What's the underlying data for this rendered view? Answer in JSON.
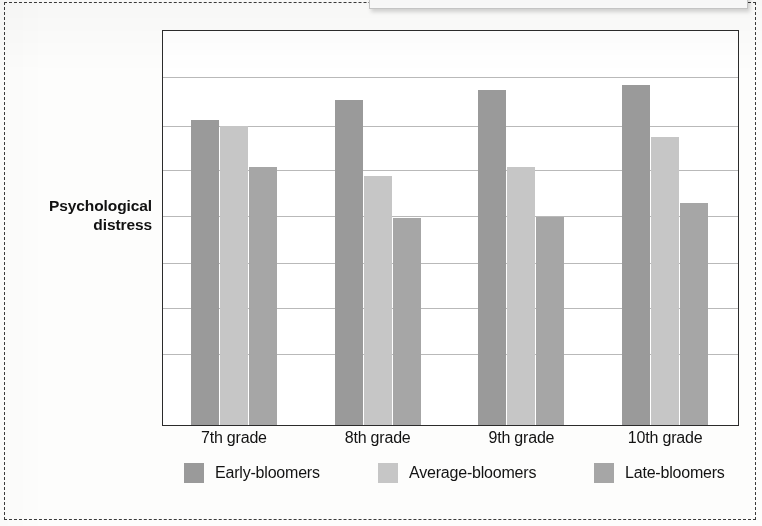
{
  "figure": {
    "frame_style": "dashed",
    "frame_color": "#3a3a3a",
    "background_color": "#fdfdfc"
  },
  "top_callout": {
    "visible_fragment": true,
    "text": "",
    "swatch_color": "#9b9b9b"
  },
  "y_axis_title": "Psychological distress",
  "legend": {
    "items": [
      {
        "label": "Early-bloomers",
        "color": "#9a9a9a",
        "left_px": 22
      },
      {
        "label": "Average-bloomers",
        "color": "#c6c6c6",
        "left_px": 216
      },
      {
        "label": "Late-bloomers",
        "color": "#a6a6a6",
        "left_px": 432
      }
    ]
  },
  "chart_data": {
    "type": "bar",
    "title": "",
    "subtitle": "",
    "xlabel": "",
    "ylabel": "Psychological distress",
    "categories": [
      "7th grade",
      "8th grade",
      "9th grade",
      "10th grade"
    ],
    "series": [
      {
        "name": "Early-bloomers",
        "color": "#9a9a9a",
        "values": [
          77.5,
          82.6,
          85.1,
          86.4
        ]
      },
      {
        "name": "Average-bloomers",
        "color": "#c6c6c6",
        "values": [
          75.8,
          63.1,
          65.4,
          73.0
        ]
      },
      {
        "name": "Late-bloomers",
        "color": "#a6a6a6",
        "values": [
          65.4,
          52.5,
          52.8,
          56.3
        ]
      }
    ],
    "ylim": [
      0,
      100
    ],
    "y_tick_labels": [],
    "x_tick_labels": [
      "7th grade",
      "8th grade",
      "9th grade",
      "10th grade"
    ],
    "gridlines": {
      "horizontal": true,
      "count": 7,
      "y_fractions": [
        0.116,
        0.24,
        0.354,
        0.47,
        0.588,
        0.703,
        0.82
      ],
      "color": "#b9b9b9"
    },
    "legend_position": "bottom",
    "bar_width_px": 28,
    "group_gap_px": 56
  }
}
